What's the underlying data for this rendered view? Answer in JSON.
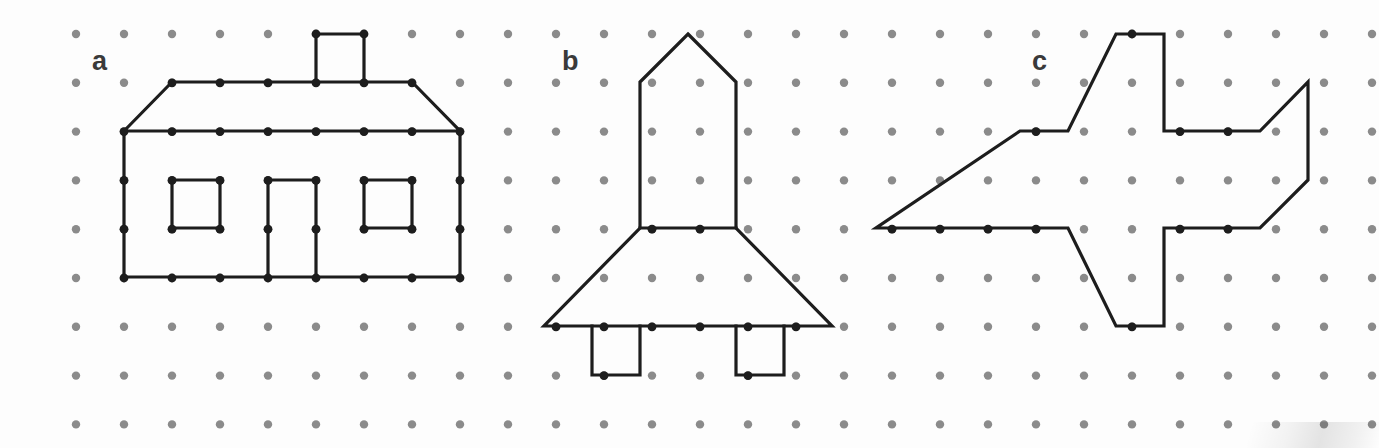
{
  "worksheet": {
    "title": "Dot grid shapes worksheet",
    "width": 1379,
    "height": 448,
    "background_color": "#fdfdfd"
  },
  "grid": {
    "dot_color": "#8b8b8b",
    "dot_radius": 4.2,
    "origin_x": 76,
    "origin_y": 34,
    "spacing_x": 48,
    "spacing_y": 48.8,
    "columns": 28,
    "rows": 9,
    "description": "isometric-free square lattice of evenly spaced round grey dots"
  },
  "stroke": {
    "color": "#1d1d1d",
    "width": 3.2,
    "linejoin": "miter",
    "linecap": "square",
    "fill": "none"
  },
  "labels": [
    {
      "id": "label-a",
      "text": "a",
      "x": 92,
      "y": 70,
      "color": "#3a3a3a",
      "size": 27
    },
    {
      "id": "label-b",
      "text": "b",
      "x": 562,
      "y": 70,
      "color": "#3a3a3a",
      "size": 27
    },
    {
      "id": "label-c",
      "text": "c",
      "x": 1032,
      "y": 70,
      "color": "#3a3a3a",
      "size": 27
    }
  ],
  "figures": [
    {
      "id": "figure-a",
      "label": "a",
      "name": "house",
      "description": "House outline with pitched roof, chimney, two square windows and a door",
      "parts": [
        {
          "id": "house-body-and-roof",
          "name": "house-outline",
          "closed": true,
          "points": [
            [
              124,
              131
            ],
            [
              172,
              82
            ],
            [
              412,
              82
            ],
            [
              460,
              131
            ],
            [
              460,
              277
            ],
            [
              124,
              277
            ]
          ]
        },
        {
          "id": "house-eave-line",
          "name": "roof-eave-line",
          "closed": false,
          "points": [
            [
              124,
              131
            ],
            [
              460,
              131
            ]
          ]
        },
        {
          "id": "house-chimney",
          "name": "chimney",
          "closed": false,
          "points": [
            [
              316,
              82
            ],
            [
              316,
              34
            ],
            [
              364,
              34
            ],
            [
              364,
              82
            ]
          ]
        },
        {
          "id": "house-window-left",
          "name": "window-left",
          "closed": true,
          "points": [
            [
              172,
              180
            ],
            [
              220,
              180
            ],
            [
              220,
              228
            ],
            [
              172,
              228
            ]
          ]
        },
        {
          "id": "house-window-right",
          "name": "window-right",
          "closed": true,
          "points": [
            [
              364,
              180
            ],
            [
              412,
              180
            ],
            [
              412,
              228
            ],
            [
              364,
              228
            ]
          ]
        },
        {
          "id": "house-door",
          "name": "door",
          "closed": false,
          "points": [
            [
              268,
              277
            ],
            [
              268,
              180
            ],
            [
              316,
              180
            ],
            [
              316,
              277
            ]
          ]
        }
      ]
    },
    {
      "id": "figure-b",
      "label": "b",
      "name": "rocket",
      "description": "Rocket outline with pointed nose cone, rectangular body, flared trapezoidal skirt and two landing legs",
      "parts": [
        {
          "id": "rocket-outline",
          "name": "rocket-outline",
          "closed": true,
          "points": [
            [
              688,
              34
            ],
            [
              736,
              82
            ],
            [
              736,
              228
            ],
            [
              832,
              326
            ],
            [
              544,
              326
            ],
            [
              640,
              228
            ],
            [
              640,
              82
            ]
          ]
        },
        {
          "id": "rocket-skirt-line",
          "name": "skirt-top-line",
          "closed": false,
          "points": [
            [
              640,
              228
            ],
            [
              736,
              228
            ]
          ]
        },
        {
          "id": "rocket-leg-left",
          "name": "landing-leg-left",
          "closed": false,
          "points": [
            [
              592,
              326
            ],
            [
              592,
              375
            ],
            [
              640,
              375
            ],
            [
              640,
              326
            ]
          ]
        },
        {
          "id": "rocket-leg-right",
          "name": "landing-leg-right",
          "closed": false,
          "points": [
            [
              736,
              326
            ],
            [
              736,
              375
            ],
            [
              784,
              375
            ],
            [
              784,
              326
            ]
          ]
        }
      ]
    },
    {
      "id": "figure-c",
      "label": "c",
      "name": "airplane",
      "description": "Airplane outline in side view with swept wings, vertical tail fin and pointed nose",
      "parts": [
        {
          "id": "airplane-outline",
          "name": "airplane-outline",
          "closed": true,
          "points": [
            [
              1116,
              34
            ],
            [
              1164,
              34
            ],
            [
              1164,
              131
            ],
            [
              1260,
              131
            ],
            [
              1308,
              82
            ],
            [
              1308,
              180
            ],
            [
              1260,
              228
            ],
            [
              1164,
              228
            ],
            [
              1164,
              326
            ],
            [
              1116,
              326
            ],
            [
              1068,
              228
            ],
            [
              972,
              228
            ],
            [
              876,
              228
            ],
            [
              1020,
              131
            ],
            [
              1068,
              131
            ]
          ]
        }
      ]
    }
  ]
}
